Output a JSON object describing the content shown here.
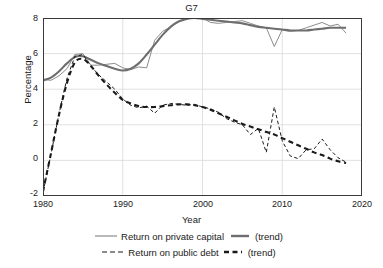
{
  "chart_data": {
    "type": "line",
    "title": "G7",
    "xlabel": "Year",
    "ylabel": "Percentage",
    "xlim": [
      1980,
      2020
    ],
    "ylim": [
      -2,
      8
    ],
    "xticks": [
      1980,
      1990,
      2000,
      2010,
      2020
    ],
    "yticks": [
      -2,
      0,
      2,
      4,
      6,
      8
    ],
    "grid": true,
    "legend_position": "below",
    "x": [
      1980,
      1981,
      1982,
      1983,
      1984,
      1985,
      1986,
      1987,
      1988,
      1989,
      1990,
      1991,
      1992,
      1993,
      1994,
      1995,
      1996,
      1997,
      1998,
      1999,
      2000,
      2001,
      2002,
      2003,
      2004,
      2005,
      2006,
      2007,
      2008,
      2009,
      2010,
      2011,
      2012,
      2013,
      2014,
      2015,
      2016,
      2017,
      2018
    ],
    "series": [
      {
        "name": "Return on private capital",
        "style": "solid-thin",
        "color": "#8c8c8c",
        "values": [
          4.55,
          4.5,
          4.75,
          5.15,
          5.95,
          6.0,
          5.35,
          5.35,
          5.4,
          5.45,
          5.2,
          5.1,
          5.25,
          5.2,
          6.75,
          7.25,
          7.5,
          7.8,
          8.0,
          8.05,
          8.0,
          7.75,
          7.7,
          7.75,
          7.8,
          7.85,
          7.7,
          7.55,
          7.45,
          6.4,
          7.35,
          7.25,
          7.3,
          7.45,
          7.6,
          7.75,
          7.55,
          7.65,
          7.15
        ]
      },
      {
        "name": "Return on private capital (trend)",
        "style": "solid-thick",
        "color": "#6e6e6e",
        "values": [
          4.5,
          4.65,
          5.0,
          5.45,
          5.8,
          5.85,
          5.65,
          5.45,
          5.3,
          5.15,
          5.05,
          5.15,
          5.45,
          5.95,
          6.5,
          7.05,
          7.5,
          7.8,
          7.95,
          8.0,
          7.95,
          7.9,
          7.85,
          7.8,
          7.75,
          7.7,
          7.6,
          7.5,
          7.45,
          7.4,
          7.35,
          7.3,
          7.3,
          7.3,
          7.35,
          7.4,
          7.45,
          7.45,
          7.45
        ]
      },
      {
        "name": "Return on public debt",
        "style": "dashed-thin",
        "color": "#1a1a1a",
        "values": [
          -1.8,
          0.35,
          2.6,
          4.6,
          5.85,
          5.95,
          5.3,
          4.8,
          4.4,
          4.0,
          3.45,
          3.1,
          2.95,
          3.05,
          2.65,
          3.1,
          3.2,
          3.15,
          3.1,
          3.15,
          3.0,
          2.9,
          2.7,
          2.35,
          2.15,
          2.0,
          1.45,
          1.8,
          0.45,
          3.0,
          1.1,
          0.25,
          0.1,
          0.6,
          0.65,
          1.2,
          0.6,
          0.15,
          -0.1
        ]
      },
      {
        "name": "Return on public debt (trend)",
        "style": "dashed-thick",
        "color": "#1a1a1a",
        "values": [
          -1.75,
          0.4,
          2.55,
          4.35,
          5.5,
          5.7,
          5.3,
          4.75,
          4.25,
          3.8,
          3.4,
          3.2,
          3.05,
          3.0,
          3.0,
          3.05,
          3.1,
          3.15,
          3.15,
          3.1,
          3.0,
          2.85,
          2.65,
          2.45,
          2.25,
          2.05,
          1.9,
          1.75,
          1.6,
          1.45,
          1.25,
          1.05,
          0.85,
          0.65,
          0.45,
          0.3,
          0.1,
          -0.05,
          -0.15
        ]
      }
    ]
  },
  "legend": {
    "rows": [
      {
        "series_label": "Return on private capital",
        "trend_label": "(trend)"
      },
      {
        "series_label": "Return on public debt",
        "trend_label": "(trend)"
      }
    ]
  }
}
